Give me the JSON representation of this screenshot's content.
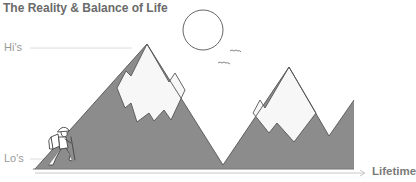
{
  "title": "The Reality & Balance of Life",
  "axis": {
    "y_high_label": "Hi's",
    "y_low_label": "Lo's",
    "x_label": "Lifetime"
  },
  "illustration": {
    "elements": [
      "sun",
      "birds",
      "snow-capped-mountains",
      "hiker"
    ],
    "colors": {
      "mountain": "#8c8c8c",
      "snow": "#f7f7f7",
      "outline": "#555555",
      "text": "#777777"
    }
  }
}
